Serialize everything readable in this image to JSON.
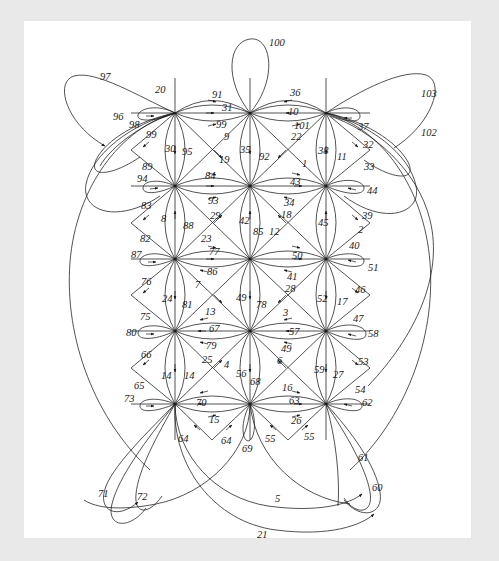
{
  "document": {
    "kind": "figure",
    "description": "Turtle-shaped graph embedding diagram with numbered directed edges",
    "page_background": "#e9e9e9",
    "sheet_background": "#ffffff",
    "ink_color": "#1a1a1a"
  },
  "chart_data": {
    "type": "diagram",
    "title": "",
    "subtitle": "",
    "xlabel": "",
    "ylabel": "",
    "grid": false,
    "legend": null,
    "vertices": [
      {
        "id": "v00",
        "row": 0,
        "col": 0,
        "x": 175,
        "y": 113
      },
      {
        "id": "v01",
        "row": 0,
        "col": 1,
        "x": 250,
        "y": 113
      },
      {
        "id": "v02",
        "row": 0,
        "col": 2,
        "x": 326,
        "y": 113
      },
      {
        "id": "v10",
        "row": 1,
        "col": 0,
        "x": 175,
        "y": 186
      },
      {
        "id": "v11",
        "row": 1,
        "col": 1,
        "x": 250,
        "y": 186
      },
      {
        "id": "v12",
        "row": 1,
        "col": 2,
        "x": 326,
        "y": 186
      },
      {
        "id": "v20",
        "row": 2,
        "col": 0,
        "x": 175,
        "y": 259
      },
      {
        "id": "v21",
        "row": 2,
        "col": 1,
        "x": 250,
        "y": 259
      },
      {
        "id": "v22",
        "row": 2,
        "col": 2,
        "x": 326,
        "y": 259
      },
      {
        "id": "v30",
        "row": 3,
        "col": 0,
        "x": 175,
        "y": 331
      },
      {
        "id": "v31",
        "row": 3,
        "col": 1,
        "x": 250,
        "y": 331
      },
      {
        "id": "v32",
        "row": 3,
        "col": 2,
        "x": 326,
        "y": 331
      },
      {
        "id": "v40",
        "row": 4,
        "col": 0,
        "x": 175,
        "y": 404
      },
      {
        "id": "v41",
        "row": 4,
        "col": 1,
        "x": 250,
        "y": 404
      },
      {
        "id": "v42",
        "row": 4,
        "col": 2,
        "x": 326,
        "y": 404
      }
    ],
    "edge_labels": [
      {
        "text": "100",
        "x": 269,
        "y": 38
      },
      {
        "text": "97",
        "x": 100,
        "y": 72
      },
      {
        "text": "20",
        "x": 155,
        "y": 85
      },
      {
        "text": "91",
        "x": 212,
        "y": 90
      },
      {
        "text": "36",
        "x": 290,
        "y": 88
      },
      {
        "text": "103",
        "x": 421,
        "y": 89
      },
      {
        "text": "96",
        "x": 113,
        "y": 112
      },
      {
        "text": "31",
        "x": 222,
        "y": 103
      },
      {
        "text": "10",
        "x": 288,
        "y": 107
      },
      {
        "text": "98",
        "x": 129,
        "y": 120
      },
      {
        "text": "99",
        "x": 146,
        "y": 130
      },
      {
        "text": "99",
        "x": 216,
        "y": 120
      },
      {
        "text": "101",
        "x": 294,
        "y": 121
      },
      {
        "text": "37",
        "x": 358,
        "y": 122
      },
      {
        "text": "102",
        "x": 421,
        "y": 128
      },
      {
        "text": "9",
        "x": 224,
        "y": 132
      },
      {
        "text": "22",
        "x": 291,
        "y": 132
      },
      {
        "text": "30",
        "x": 165,
        "y": 144
      },
      {
        "text": "95",
        "x": 182,
        "y": 147
      },
      {
        "text": "35",
        "x": 240,
        "y": 145
      },
      {
        "text": "92",
        "x": 259,
        "y": 152
      },
      {
        "text": "38",
        "x": 318,
        "y": 146
      },
      {
        "text": "11",
        "x": 337,
        "y": 152
      },
      {
        "text": "32",
        "x": 363,
        "y": 140
      },
      {
        "text": "19",
        "x": 219,
        "y": 155
      },
      {
        "text": "1",
        "x": 302,
        "y": 159
      },
      {
        "text": "33",
        "x": 364,
        "y": 162
      },
      {
        "text": "89",
        "x": 142,
        "y": 162
      },
      {
        "text": "94",
        "x": 137,
        "y": 174
      },
      {
        "text": "84",
        "x": 205,
        "y": 171
      },
      {
        "text": "43",
        "x": 290,
        "y": 177
      },
      {
        "text": "44",
        "x": 367,
        "y": 186
      },
      {
        "text": "83",
        "x": 141,
        "y": 201
      },
      {
        "text": "93",
        "x": 208,
        "y": 196
      },
      {
        "text": "34",
        "x": 284,
        "y": 198
      },
      {
        "text": "8",
        "x": 161,
        "y": 214
      },
      {
        "text": "88",
        "x": 183,
        "y": 221
      },
      {
        "text": "29",
        "x": 210,
        "y": 211
      },
      {
        "text": "42",
        "x": 239,
        "y": 216
      },
      {
        "text": "85",
        "x": 253,
        "y": 227
      },
      {
        "text": "18",
        "x": 281,
        "y": 210
      },
      {
        "text": "12",
        "x": 269,
        "y": 227
      },
      {
        "text": "45",
        "x": 318,
        "y": 218
      },
      {
        "text": "2",
        "x": 358,
        "y": 225
      },
      {
        "text": "39",
        "x": 362,
        "y": 211
      },
      {
        "text": "82",
        "x": 140,
        "y": 234
      },
      {
        "text": "23",
        "x": 201,
        "y": 234
      },
      {
        "text": "77",
        "x": 209,
        "y": 247
      },
      {
        "text": "50",
        "x": 292,
        "y": 251
      },
      {
        "text": "40",
        "x": 349,
        "y": 241
      },
      {
        "text": "87",
        "x": 131,
        "y": 250
      },
      {
        "text": "86",
        "x": 207,
        "y": 267
      },
      {
        "text": "41",
        "x": 287,
        "y": 272
      },
      {
        "text": "51",
        "x": 368,
        "y": 263
      },
      {
        "text": "76",
        "x": 141,
        "y": 277
      },
      {
        "text": "7",
        "x": 195,
        "y": 280
      },
      {
        "text": "49",
        "x": 236,
        "y": 293
      },
      {
        "text": "78",
        "x": 256,
        "y": 300
      },
      {
        "text": "28",
        "x": 285,
        "y": 284
      },
      {
        "text": "46",
        "x": 355,
        "y": 285
      },
      {
        "text": "24",
        "x": 162,
        "y": 294
      },
      {
        "text": "81",
        "x": 182,
        "y": 300
      },
      {
        "text": "52",
        "x": 317,
        "y": 294
      },
      {
        "text": "17",
        "x": 337,
        "y": 297
      },
      {
        "text": "75",
        "x": 140,
        "y": 312
      },
      {
        "text": "13",
        "x": 205,
        "y": 307
      },
      {
        "text": "3",
        "x": 283,
        "y": 308
      },
      {
        "text": "47",
        "x": 353,
        "y": 314
      },
      {
        "text": "67",
        "x": 209,
        "y": 324
      },
      {
        "text": "57",
        "x": 289,
        "y": 327
      },
      {
        "text": "58",
        "x": 368,
        "y": 329
      },
      {
        "text": "80",
        "x": 126,
        "y": 328
      },
      {
        "text": "79",
        "x": 206,
        "y": 341
      },
      {
        "text": "49",
        "x": 281,
        "y": 344
      },
      {
        "text": "66",
        "x": 141,
        "y": 350
      },
      {
        "text": "25",
        "x": 202,
        "y": 355
      },
      {
        "text": "4",
        "x": 224,
        "y": 360
      },
      {
        "text": "6",
        "x": 277,
        "y": 356
      },
      {
        "text": "53",
        "x": 358,
        "y": 357
      },
      {
        "text": "14",
        "x": 161,
        "y": 371
      },
      {
        "text": "14",
        "x": 184,
        "y": 371
      },
      {
        "text": "56",
        "x": 236,
        "y": 369
      },
      {
        "text": "68",
        "x": 250,
        "y": 377
      },
      {
        "text": "59",
        "x": 314,
        "y": 365
      },
      {
        "text": "27",
        "x": 333,
        "y": 370
      },
      {
        "text": "65",
        "x": 134,
        "y": 381
      },
      {
        "text": "16",
        "x": 282,
        "y": 383
      },
      {
        "text": "54",
        "x": 355,
        "y": 385
      },
      {
        "text": "73",
        "x": 124,
        "y": 394
      },
      {
        "text": "70",
        "x": 196,
        "y": 398
      },
      {
        "text": "63",
        "x": 289,
        "y": 396
      },
      {
        "text": "62",
        "x": 362,
        "y": 398
      },
      {
        "text": "15",
        "x": 209,
        "y": 415
      },
      {
        "text": "26",
        "x": 291,
        "y": 416
      },
      {
        "text": "64",
        "x": 178,
        "y": 434
      },
      {
        "text": "64",
        "x": 221,
        "y": 436
      },
      {
        "text": "69",
        "x": 242,
        "y": 444
      },
      {
        "text": "55",
        "x": 265,
        "y": 434
      },
      {
        "text": "55",
        "x": 304,
        "y": 432
      },
      {
        "text": "61",
        "x": 358,
        "y": 453
      },
      {
        "text": "60",
        "x": 372,
        "y": 483
      },
      {
        "text": "71",
        "x": 98,
        "y": 489
      },
      {
        "text": "72",
        "x": 137,
        "y": 492
      },
      {
        "text": "5",
        "x": 275,
        "y": 494
      },
      {
        "text": "21",
        "x": 257,
        "y": 530
      }
    ]
  }
}
